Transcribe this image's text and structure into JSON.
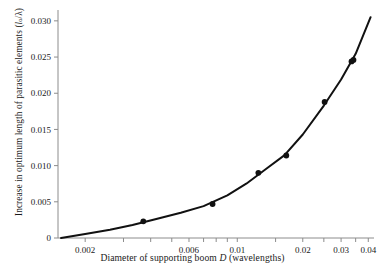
{
  "chart_data": {
    "type": "scatter",
    "title": "",
    "xlabel": "Diameter of supporting boom D (wavelengths)",
    "ylabel": "Increase in optimum length of parasitic elements (l₀/λ)",
    "xscale": "log",
    "yscale": "linear",
    "xlim": [
      0.0015,
      0.0425
    ],
    "ylim": [
      0,
      0.0315
    ],
    "grid": false,
    "legend": null,
    "xticks_labeled": [
      "0.002",
      "0.006",
      "0.01",
      "0.02",
      "0.03",
      "0.04"
    ],
    "xtick_values": [
      0.002,
      0.006,
      0.01,
      0.02,
      0.03,
      0.04
    ],
    "xticks_minor": [
      0.003,
      0.004,
      0.005,
      0.007,
      0.008,
      0.009,
      0.015,
      0.025,
      0.035
    ],
    "yticks_labeled": [
      "0",
      "0.005",
      "0.010",
      "0.015",
      "0.020",
      "0.025",
      "0.030"
    ],
    "ytick_values": [
      0,
      0.005,
      0.01,
      0.015,
      0.02,
      0.025,
      0.03
    ],
    "series": [
      {
        "name": "measured points",
        "marker": "filled-circle",
        "color": "#111111",
        "points": [
          {
            "x": 0.0037,
            "y": 0.0023
          },
          {
            "x": 0.0077,
            "y": 0.0047
          },
          {
            "x": 0.0125,
            "y": 0.009
          },
          {
            "x": 0.0168,
            "y": 0.0114
          },
          {
            "x": 0.0252,
            "y": 0.0188
          },
          {
            "x": 0.0335,
            "y": 0.0244
          },
          {
            "x": 0.0342,
            "y": 0.0246
          }
        ]
      },
      {
        "name": "fitted curve",
        "marker": "none",
        "color": "#111111",
        "points": [
          {
            "x": 0.00155,
            "y": 0.0
          },
          {
            "x": 0.002,
            "y": 0.00055
          },
          {
            "x": 0.0026,
            "y": 0.00115
          },
          {
            "x": 0.0033,
            "y": 0.0018
          },
          {
            "x": 0.0042,
            "y": 0.0026
          },
          {
            "x": 0.0055,
            "y": 0.0035
          },
          {
            "x": 0.007,
            "y": 0.0044
          },
          {
            "x": 0.009,
            "y": 0.0059
          },
          {
            "x": 0.011,
            "y": 0.0075
          },
          {
            "x": 0.0135,
            "y": 0.0095
          },
          {
            "x": 0.0165,
            "y": 0.01145
          },
          {
            "x": 0.02,
            "y": 0.0143
          },
          {
            "x": 0.025,
            "y": 0.0183
          },
          {
            "x": 0.03,
            "y": 0.0219
          },
          {
            "x": 0.035,
            "y": 0.02545
          },
          {
            "x": 0.041,
            "y": 0.0305
          }
        ]
      }
    ]
  },
  "axis": {
    "x_label_text": "Diameter of supporting boom ",
    "x_label_var": "D",
    "x_label_tail": " (wavelengths)",
    "y_label_text": "Increase in optimum length of parasitic elements (",
    "y_label_var": "l",
    "y_label_sub": "o",
    "y_label_tail": "/λ)"
  },
  "colors": {
    "data": "#111111",
    "spine": "#8c8c8c",
    "text": "#1a1a1a",
    "background": "#ffffff"
  }
}
